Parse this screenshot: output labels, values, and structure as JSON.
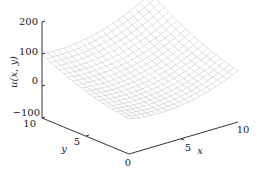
{
  "chart_data": {
    "type": "surface3d",
    "title": "",
    "xlabel": "x",
    "ylabel": "y",
    "zlabel": "u(x,y)",
    "x_ticks": [
      0,
      5,
      10
    ],
    "y_ticks": [
      0,
      5,
      10
    ],
    "z_ticks": [
      -100,
      0,
      100,
      200
    ],
    "xlim": [
      0,
      10
    ],
    "ylim": [
      0,
      10
    ],
    "zlim": [
      -100,
      200
    ],
    "grid_resolution": 20,
    "surface_description": "Bowl-shaped (convex) wireframe surface; lowest near x=5..7, y=0..2 (~ -20), rising to ~100 at x=0,y=10 and ~200 at x=10,y=10",
    "corner_values": {
      "x0_y0": 10,
      "x10_y0": 60,
      "x0_y10": 100,
      "x10_y10": 190
    },
    "mesh_color": "#c8c8c8",
    "axis_color": "#333333"
  },
  "labels": {
    "z_axis": "u(x, y)",
    "x_axis": "x",
    "y_axis": "y",
    "x_tick_0": "0",
    "x_tick_5": "5",
    "x_tick_10": "10",
    "y_tick_5": "5",
    "y_tick_10": "10",
    "z_tick_m100": "−100",
    "z_tick_0": "0",
    "z_tick_100": "100",
    "z_tick_200": "200"
  }
}
